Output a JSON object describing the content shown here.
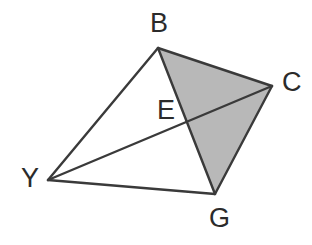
{
  "figure": {
    "width": 312,
    "height": 245,
    "background_color": "#ffffff",
    "stroke_color": "#3a3a3a",
    "stroke_width": 2.4,
    "shaded_fill_color": "#b8b8b8",
    "label_color": "#2b2b2b",
    "label_font_size": 27
  },
  "points": {
    "B": {
      "label": "B",
      "x": 158,
      "y": 48,
      "label_x": 150,
      "label_y": 10
    },
    "C": {
      "label": "C",
      "x": 272,
      "y": 86,
      "label_x": 282,
      "label_y": 69
    },
    "E": {
      "label": "E",
      "x": 188,
      "y": 122,
      "label_x": 157,
      "label_y": 97
    },
    "Y": {
      "label": "Y",
      "x": 48,
      "y": 180,
      "label_x": 21,
      "label_y": 165
    },
    "G": {
      "label": "G",
      "x": 215,
      "y": 194,
      "label_x": 209,
      "label_y": 205
    }
  },
  "shaded_region": {
    "name": "triangle-BCG",
    "vertices": [
      "B",
      "C",
      "G"
    ],
    "polygon_points": "158,48 272,86 215,194",
    "fill": "#b8b8b8"
  },
  "segments": [
    {
      "name": "segment-YB",
      "from": "Y",
      "to": "B",
      "d": "M 48 180 L 158 48"
    },
    {
      "name": "segment-BC",
      "from": "B",
      "to": "C",
      "d": "M 158 48 L 272 86"
    },
    {
      "name": "segment-CG",
      "from": "C",
      "to": "G",
      "d": "M 272 86 L 215 194"
    },
    {
      "name": "segment-GY",
      "from": "G",
      "to": "Y",
      "d": "M 215 194 L 48 180"
    },
    {
      "name": "segment-BG-diagonal",
      "from": "B",
      "to": "G",
      "d": "M 158 48 L 215 194"
    },
    {
      "name": "segment-YC-diagonal",
      "from": "Y",
      "to": "C",
      "d": "M 48 180 L 272 86"
    }
  ]
}
